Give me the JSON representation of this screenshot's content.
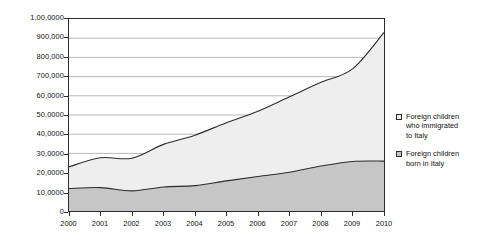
{
  "chart_data": {
    "type": "area",
    "stacked": true,
    "title": "",
    "xlabel": "",
    "ylabel": "",
    "grid": true,
    "legend_position": "right",
    "x": [
      2000,
      2001,
      2002,
      2003,
      2004,
      2005,
      2006,
      2007,
      2008,
      2009,
      2010
    ],
    "categories": [
      "2000",
      "2001",
      "2002",
      "2003",
      "2004",
      "2005",
      "2006",
      "2007",
      "2008",
      "2009",
      "2010"
    ],
    "ylim": [
      0,
      1000000
    ],
    "ytick_values": [
      0,
      100000,
      200000,
      300000,
      400000,
      500000,
      600000,
      700000,
      800000,
      900000,
      1000000
    ],
    "ytick_labels": [
      "0",
      "10,0000",
      "20,0000",
      "30,0000",
      "40,0000",
      "50,0000",
      "60,0000",
      "700,000",
      "800,000",
      "900,000",
      "1,00,0000"
    ],
    "series": [
      {
        "name": "Foreign children born in Italy",
        "legend_label": "Foreign children\nborn in Italy",
        "color": "#c6c6c6",
        "values": [
          117000,
          122000,
          105000,
          125000,
          132000,
          157000,
          180000,
          202000,
          234000,
          258000,
          260000
        ]
      },
      {
        "name": "Foreign children who immigrated to Italy",
        "legend_label": "Foreign children\nwho immigrated\nto Italy",
        "color": "#eeeeee",
        "values": [
          113000,
          155000,
          170000,
          222000,
          263000,
          303000,
          340000,
          393000,
          436000,
          482000,
          670000
        ]
      }
    ],
    "stacked_totals": [
      230000,
      277000,
      275000,
      347000,
      395000,
      460000,
      520000,
      595000,
      670000,
      740000,
      930000
    ]
  },
  "legend": {
    "entries": [
      {
        "label": "Foreign children\nwho immigrated\nto Italy",
        "swatch": "immigrated"
      },
      {
        "label": "Foreign children\nborn in Italy",
        "swatch": "born"
      }
    ]
  }
}
